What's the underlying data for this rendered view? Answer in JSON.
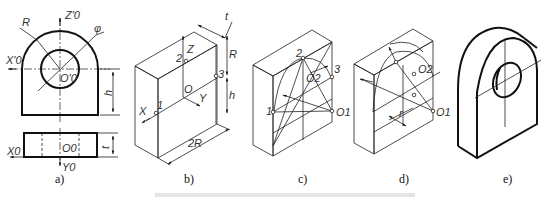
{
  "figure": {
    "panels": [
      {
        "id": "a",
        "caption": "a)",
        "description": "Orthographic views (front and top) of a round-topped plate with hole",
        "labels": {
          "z_axis": "Z'0",
          "x_axis_front": "X'0",
          "origin_front": "O'0",
          "radius": "R",
          "diameter": "φ",
          "height": "h",
          "x_axis_top": "X0",
          "origin_top": "O0",
          "y_axis": "Y0",
          "thickness": "t"
        }
      },
      {
        "id": "b",
        "caption": "b)",
        "description": "Bounding box in isometric with axes and points",
        "labels": {
          "thickness": "t",
          "z_axis": "Z",
          "radius": "R",
          "height": "h",
          "origin": "O",
          "x_axis": "X",
          "y_axis": "Y",
          "width": "2R",
          "point1": "1",
          "point2": "2",
          "point3": "3"
        }
      },
      {
        "id": "c",
        "caption": "c)",
        "description": "Four-center approximate ellipse construction",
        "labels": {
          "point1": "1",
          "point2": "2",
          "point3": "3",
          "center1": "O1",
          "center2": "O2"
        }
      },
      {
        "id": "d",
        "caption": "d)",
        "description": "Transfer of arc centers to back face",
        "labels": {
          "center1": "O1",
          "center2": "O2",
          "offset": "r"
        }
      },
      {
        "id": "e",
        "caption": "e)",
        "description": "Finished isometric drawing"
      }
    ]
  }
}
